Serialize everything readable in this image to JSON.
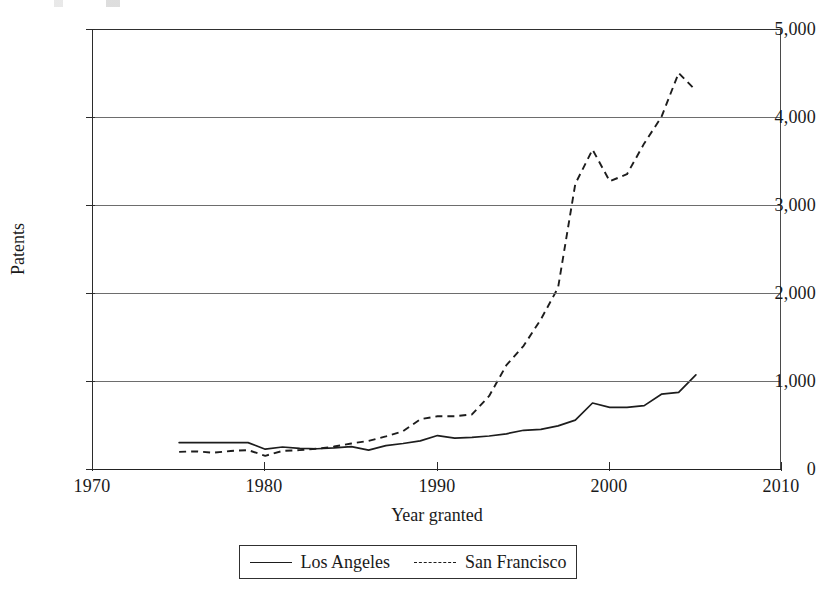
{
  "figure": {
    "background": "#ffffff",
    "ink_color": "#1d1d1d",
    "gridline_color": "#6d6d6d"
  },
  "chart_data": {
    "type": "line",
    "title": "",
    "xlabel": "Year granted",
    "ylabel": "Patents",
    "xlim": [
      1970,
      2010
    ],
    "ylim": [
      0,
      5000
    ],
    "xticks": [
      1970,
      1980,
      1990,
      2000,
      2010
    ],
    "xtick_labels": [
      "1970",
      "1980",
      "1990",
      "2000",
      "2010"
    ],
    "yticks": [
      0,
      1000,
      2000,
      3000,
      4000,
      5000
    ],
    "ytick_labels": [
      "0",
      "1,000",
      "2,000",
      "3,000",
      "4,000",
      "5,000"
    ],
    "grid": "horizontal",
    "legend_position": "below-axes",
    "x": [
      1975,
      1976,
      1977,
      1978,
      1979,
      1980,
      1981,
      1982,
      1983,
      1984,
      1985,
      1986,
      1987,
      1988,
      1989,
      1990,
      1991,
      1992,
      1993,
      1994,
      1995,
      1996,
      1997,
      1998,
      1999,
      2000,
      2001,
      2002,
      2003,
      2004,
      2005
    ],
    "series": [
      {
        "name": "Los Angeles",
        "linestyle": "solid",
        "color": "#1d1d1d",
        "values": [
          300,
          300,
          300,
          300,
          300,
          225,
          250,
          235,
          230,
          240,
          255,
          215,
          265,
          290,
          320,
          380,
          350,
          360,
          375,
          400,
          440,
          450,
          490,
          555,
          750,
          700,
          700,
          720,
          850,
          870,
          1070
        ]
      },
      {
        "name": "San Francisco",
        "linestyle": "dashed",
        "color": "#1d1d1d",
        "values": [
          195,
          200,
          185,
          205,
          215,
          150,
          205,
          215,
          230,
          255,
          290,
          320,
          370,
          430,
          565,
          600,
          600,
          620,
          830,
          1180,
          1400,
          1700,
          2060,
          3240,
          3630,
          3270,
          3350,
          3700,
          4000,
          4500,
          4300
        ]
      }
    ]
  },
  "legend": {
    "entries": [
      {
        "label": "Los Angeles",
        "style": "solid"
      },
      {
        "label": "San Francisco",
        "style": "dashed"
      }
    ]
  }
}
